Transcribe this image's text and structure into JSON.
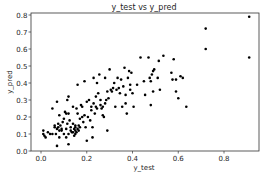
{
  "chart_data": {
    "type": "scatter",
    "title": "y_test vs y_pred",
    "xlabel": "y_test",
    "ylabel": "y_pred",
    "xlim": [
      -0.03,
      0.95
    ],
    "ylim": [
      0.0,
      0.82
    ],
    "xticks": [
      0.0,
      0.2,
      0.4,
      0.6,
      0.8
    ],
    "xtick_labels": [
      "0.0",
      "0.2",
      "0.4",
      "0.6",
      "0.8"
    ],
    "yticks": [
      0.0,
      0.1,
      0.2,
      0.3,
      0.4,
      0.5,
      0.6,
      0.7,
      0.8
    ],
    "ytick_labels": [
      "0.0",
      "0.1",
      "0.2",
      "0.3",
      "0.4",
      "0.5",
      "0.6",
      "0.7",
      "0.8"
    ],
    "grid": false,
    "legend": null,
    "marker_color": "#000000",
    "points": [
      [
        0.01,
        0.12
      ],
      [
        0.01,
        0.1
      ],
      [
        0.015,
        0.09
      ],
      [
        0.02,
        0.08
      ],
      [
        0.03,
        0.11
      ],
      [
        0.04,
        0.1
      ],
      [
        0.05,
        0.1
      ],
      [
        0.05,
        0.25
      ],
      [
        0.06,
        0.15
      ],
      [
        0.06,
        0.14
      ],
      [
        0.065,
        0.1
      ],
      [
        0.07,
        0.29
      ],
      [
        0.07,
        0.13
      ],
      [
        0.07,
        0.03
      ],
      [
        0.075,
        0.16
      ],
      [
        0.075,
        0.14
      ],
      [
        0.08,
        0.21
      ],
      [
        0.08,
        0.12
      ],
      [
        0.08,
        0.08
      ],
      [
        0.085,
        0.15
      ],
      [
        0.09,
        0.13
      ],
      [
        0.09,
        0.12
      ],
      [
        0.095,
        0.17
      ],
      [
        0.1,
        0.19
      ],
      [
        0.1,
        0.1
      ],
      [
        0.105,
        0.23
      ],
      [
        0.11,
        0.08
      ],
      [
        0.11,
        0.22
      ],
      [
        0.11,
        0.13
      ],
      [
        0.115,
        0.3
      ],
      [
        0.115,
        0.16
      ],
      [
        0.12,
        0.32
      ],
      [
        0.12,
        0.22
      ],
      [
        0.12,
        0.1
      ],
      [
        0.12,
        0.04
      ],
      [
        0.125,
        0.18
      ],
      [
        0.13,
        0.14
      ],
      [
        0.13,
        0.12
      ],
      [
        0.135,
        0.11
      ],
      [
        0.14,
        0.16
      ],
      [
        0.14,
        0.26
      ],
      [
        0.14,
        0.11
      ],
      [
        0.145,
        0.09
      ],
      [
        0.145,
        0.13
      ],
      [
        0.15,
        0.14
      ],
      [
        0.15,
        0.12
      ],
      [
        0.15,
        0.1
      ],
      [
        0.15,
        0.15
      ],
      [
        0.155,
        0.25
      ],
      [
        0.155,
        0.11
      ],
      [
        0.16,
        0.13
      ],
      [
        0.16,
        0.22
      ],
      [
        0.16,
        0.39
      ],
      [
        0.165,
        0.15
      ],
      [
        0.165,
        0.12
      ],
      [
        0.17,
        0.19
      ],
      [
        0.17,
        0.14
      ],
      [
        0.175,
        0.27
      ],
      [
        0.18,
        0.2
      ],
      [
        0.18,
        0.26
      ],
      [
        0.185,
        0.17
      ],
      [
        0.19,
        0.41
      ],
      [
        0.19,
        0.21
      ],
      [
        0.195,
        0.14
      ],
      [
        0.2,
        0.06
      ],
      [
        0.2,
        0.29
      ],
      [
        0.205,
        0.2
      ],
      [
        0.21,
        0.3
      ],
      [
        0.215,
        0.18
      ],
      [
        0.22,
        0.24
      ],
      [
        0.22,
        0.26
      ],
      [
        0.225,
        0.14
      ],
      [
        0.225,
        0.08
      ],
      [
        0.23,
        0.43
      ],
      [
        0.23,
        0.28
      ],
      [
        0.235,
        0.22
      ],
      [
        0.24,
        0.26
      ],
      [
        0.24,
        0.32
      ],
      [
        0.245,
        0.4
      ],
      [
        0.245,
        0.25
      ],
      [
        0.25,
        0.34
      ],
      [
        0.255,
        0.45
      ],
      [
        0.26,
        0.27
      ],
      [
        0.26,
        0.3
      ],
      [
        0.265,
        0.25
      ],
      [
        0.27,
        0.26
      ],
      [
        0.27,
        0.21
      ],
      [
        0.275,
        0.2
      ],
      [
        0.28,
        0.43
      ],
      [
        0.28,
        0.28
      ],
      [
        0.285,
        0.3
      ],
      [
        0.29,
        0.12
      ],
      [
        0.29,
        0.35
      ],
      [
        0.295,
        0.31
      ],
      [
        0.3,
        0.48
      ],
      [
        0.305,
        0.36
      ],
      [
        0.31,
        0.35
      ],
      [
        0.315,
        0.37
      ],
      [
        0.32,
        0.4
      ],
      [
        0.325,
        0.26
      ],
      [
        0.33,
        0.36
      ],
      [
        0.335,
        0.43
      ],
      [
        0.34,
        0.37
      ],
      [
        0.345,
        0.34
      ],
      [
        0.35,
        0.42
      ],
      [
        0.355,
        0.26
      ],
      [
        0.36,
        0.38
      ],
      [
        0.365,
        0.49
      ],
      [
        0.37,
        0.33
      ],
      [
        0.37,
        0.28
      ],
      [
        0.375,
        0.22
      ],
      [
        0.38,
        0.43
      ],
      [
        0.385,
        0.47
      ],
      [
        0.39,
        0.39
      ],
      [
        0.39,
        0.36
      ],
      [
        0.395,
        0.46
      ],
      [
        0.4,
        0.34
      ],
      [
        0.405,
        0.26
      ],
      [
        0.42,
        0.39
      ],
      [
        0.435,
        0.55
      ],
      [
        0.45,
        0.41
      ],
      [
        0.455,
        0.33
      ],
      [
        0.47,
        0.55
      ],
      [
        0.475,
        0.43
      ],
      [
        0.48,
        0.41
      ],
      [
        0.48,
        0.27
      ],
      [
        0.485,
        0.45
      ],
      [
        0.49,
        0.47
      ],
      [
        0.49,
        0.35
      ],
      [
        0.495,
        0.48
      ],
      [
        0.51,
        0.43
      ],
      [
        0.515,
        0.53
      ],
      [
        0.52,
        0.36
      ],
      [
        0.535,
        0.56
      ],
      [
        0.57,
        0.46
      ],
      [
        0.575,
        0.42
      ],
      [
        0.58,
        0.54
      ],
      [
        0.59,
        0.42
      ],
      [
        0.59,
        0.35
      ],
      [
        0.6,
        0.31
      ],
      [
        0.61,
        0.44
      ],
      [
        0.62,
        0.43
      ],
      [
        0.635,
        0.26
      ],
      [
        0.72,
        0.72
      ],
      [
        0.72,
        0.6
      ],
      [
        0.91,
        0.79
      ],
      [
        0.91,
        0.55
      ]
    ]
  }
}
